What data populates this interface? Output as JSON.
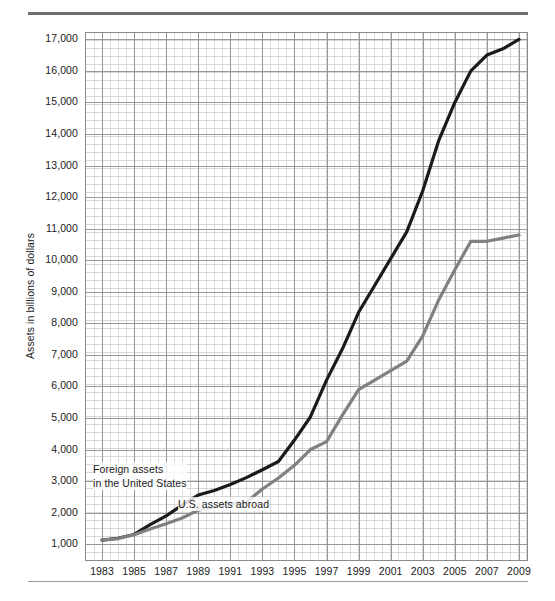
{
  "figure": {
    "name": "us-international-investment-position-line-chart",
    "top_rule": "",
    "bottom_rule": ""
  },
  "chart_data": {
    "type": "line",
    "title": "",
    "subtitle": "",
    "xlabel": "",
    "ylabel": "Assets in billions of dollars",
    "xlim": [
      1982,
      2009.5
    ],
    "ylim": [
      500,
      17200
    ],
    "grid": true,
    "grid_minor_step": 250,
    "legend_position": "inline-annotations",
    "y_ticks": [
      1000,
      2000,
      3000,
      4000,
      5000,
      6000,
      7000,
      8000,
      9000,
      10000,
      11000,
      12000,
      13000,
      14000,
      15000,
      16000,
      17000
    ],
    "y_tick_labels": [
      "1,000",
      "2,000",
      "3,000",
      "4,000",
      "5,000",
      "6,000",
      "7,000",
      "8,000",
      "9,000",
      "10,000",
      "11,000",
      "12,000",
      "13,000",
      "14,000",
      "15,000",
      "16,000",
      "17,000"
    ],
    "x_ticks": [
      1983,
      1985,
      1987,
      1989,
      1991,
      1993,
      1995,
      1997,
      1999,
      2001,
      2003,
      2005,
      2007,
      2009
    ],
    "x_tick_labels": [
      "1983",
      "1985",
      "1987",
      "1989",
      "1991",
      "1993",
      "1995",
      "1997",
      "1999",
      "2001",
      "2003",
      "2005",
      "2007",
      "2009"
    ],
    "x": [
      1983,
      1984,
      1985,
      1986,
      1987,
      1988,
      1989,
      1990,
      1991,
      1992,
      1993,
      1994,
      1995,
      1996,
      1997,
      1998,
      1999,
      2000,
      2001,
      2002,
      2003,
      2004,
      2005,
      2006,
      2007,
      2008,
      2009
    ],
    "series": [
      {
        "name": "Foreign assets in the United States",
        "color": "#1a1a1a",
        "label_text": "Foreign assets\nin the United States",
        "values": [
          1130,
          1190,
          1310,
          1620,
          1900,
          2240,
          2560,
          2700,
          2890,
          3110,
          3360,
          3620,
          4300,
          5040,
          6200,
          7200,
          8350,
          9200,
          10050,
          10900,
          12200,
          13800,
          15000,
          16000,
          16500,
          16700,
          17000
        ]
      },
      {
        "name": "U.S. assets abroad",
        "color": "#808080",
        "label_text": "U.S. assets abroad",
        "values": [
          1130,
          1180,
          1300,
          1480,
          1650,
          1830,
          2080,
          2180,
          2280,
          2330,
          2750,
          3100,
          3500,
          4000,
          4250,
          5100,
          5900,
          6200,
          6500,
          6800,
          7600,
          8750,
          9700,
          10600,
          10600,
          10700,
          10800
        ]
      }
    ]
  },
  "axis_labels": {
    "y_axis_title": "Assets in billions of dollars"
  }
}
